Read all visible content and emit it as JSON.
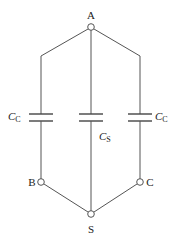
{
  "diagram": {
    "nodes": {
      "A": {
        "label": "A",
        "x": 91,
        "y": 27
      },
      "B": {
        "label": "B",
        "x": 41,
        "y": 182
      },
      "C": {
        "label": "C",
        "x": 140,
        "y": 182
      },
      "S": {
        "label": "S",
        "x": 91,
        "y": 214
      }
    },
    "capacitors": {
      "left": {
        "symbol": "C",
        "subscript": "C"
      },
      "center": {
        "symbol": "C",
        "subscript": "S"
      },
      "right": {
        "symbol": "C",
        "subscript": "C"
      }
    },
    "colors": {
      "wire": "#555555",
      "text": "#222222",
      "background": "#ffffff"
    }
  }
}
